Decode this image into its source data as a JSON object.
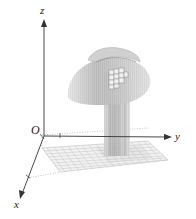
{
  "figure": {
    "type": "3d-surface-diagram",
    "axes": {
      "x_label": "x",
      "y_label": "y",
      "z_label": "z",
      "origin_label": "O"
    },
    "elements": [
      "xy-plane grid (square region)",
      "vertical rectangular column rising from grid",
      "dome/cap surface above column",
      "small grid patch on cap"
    ],
    "colors": {
      "axis": "#333333",
      "grid_line": "#b8b8b8",
      "surface_fill": "#d4d4d4",
      "surface_shade": "#a8a8a8",
      "column_fill": "#c8c8c8"
    }
  }
}
